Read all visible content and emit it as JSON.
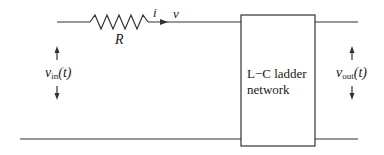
{
  "diagram": {
    "type": "circuit-schematic",
    "colors": {
      "stroke": "#333333",
      "background": "#ffffff"
    },
    "components": {
      "resistor": {
        "label": "R"
      },
      "current": {
        "label": "i"
      },
      "node_voltage": {
        "label": "v"
      },
      "network_box": {
        "line1": "L−C ladder",
        "line2": "network"
      }
    },
    "input_voltage": {
      "symbol": "v",
      "subscript": "in",
      "arg": "(t)"
    },
    "output_voltage": {
      "symbol": "v",
      "subscript": "out",
      "arg": "(t)"
    }
  }
}
